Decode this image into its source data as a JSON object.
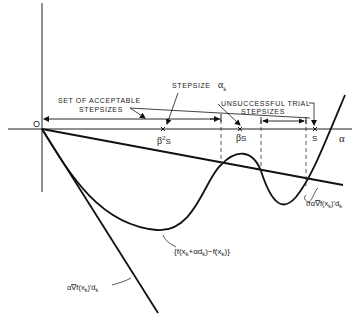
{
  "diagram": {
    "type": "line-search-armijo-rule",
    "origin_label": "O",
    "axis_label": "α",
    "labels": {
      "stepsize": "STEPSIZE",
      "stepsize_symbol": "α",
      "stepsize_sub": "k",
      "acceptable_line1": "SET OF ACCEPTABLE",
      "acceptable_line2": "STEPSIZES",
      "unsuccessful_line1": "UNSUCCESSFUL TRIAL",
      "unsuccessful_line2": "STEPSIZES",
      "beta2s_beta": "β",
      "beta2s_sup": "2",
      "beta2s_s": "S",
      "betas_beta": "β",
      "betas_s": "S",
      "s": "S",
      "curve": "{f(x_k+αd_k) - f(x_k)}",
      "curve_parts": [
        "{f(x",
        "k",
        "+αd",
        "k",
        ")−f(x",
        "k",
        ")}"
      ],
      "tangent": "α∇f(x_k)'d_k",
      "tangent_parts": [
        "α∇f(x",
        "k",
        ")'d",
        "k"
      ],
      "sigma_line": "σα∇f(x_k)'d_k",
      "sigma_parts": [
        "σα∇f(x",
        "k",
        ")'d",
        "k"
      ]
    },
    "points": {
      "origin": [
        42,
        129
      ],
      "beta2s_x": 163,
      "betas_x": 240,
      "s_x": 315,
      "dashed_x": [
        221,
        261,
        306
      ]
    },
    "colors": {
      "ink": "#111111",
      "background": "#ffffff"
    }
  }
}
